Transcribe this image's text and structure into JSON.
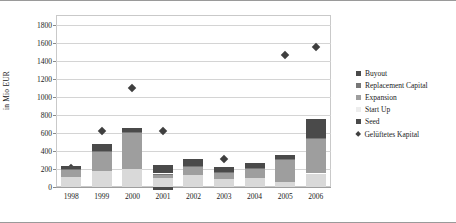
{
  "chart_data": {
    "type": "bar",
    "title": "",
    "subtitle": "",
    "xlabel": "",
    "ylabel": "in Mio EUR",
    "stacked": true,
    "grid": true,
    "legend_position": "right",
    "ylim": [
      0,
      1800
    ],
    "yticks": [
      0,
      200,
      400,
      600,
      800,
      1000,
      1200,
      1400,
      1600,
      1800
    ],
    "categories": [
      "1998",
      "1999",
      "2000",
      "2001",
      "2002",
      "2003",
      "2004",
      "2005",
      "2006"
    ],
    "series": [
      {
        "name": "Seed",
        "color": "#d9d9d9",
        "values": [
          115,
          180,
          205,
          95,
          130,
          90,
          100,
          55,
          150
        ]
      },
      {
        "name": "Start Up",
        "color": "#ededed",
        "values": [
          0,
          0,
          0,
          0,
          0,
          0,
          0,
          0,
          0
        ]
      },
      {
        "name": "Expansion",
        "color": "#9e9e9e",
        "values": [
          70,
          215,
          400,
          45,
          95,
          65,
          100,
          250,
          380
        ]
      },
      {
        "name": "Replacement Capital",
        "color": "#777777",
        "values": [
          10,
          10,
          10,
          10,
          10,
          10,
          10,
          10,
          10
        ]
      },
      {
        "name": "Buyout",
        "color": "#4a4a4a",
        "values": [
          35,
          70,
          45,
          95,
          75,
          60,
          55,
          45,
          220
        ]
      }
    ],
    "negative_series": {
      "name": "Buyout",
      "values": [
        0,
        0,
        0,
        -30,
        0,
        0,
        0,
        0,
        0
      ]
    },
    "marker_series": {
      "name": "Gelüftetes Kapital",
      "color": "#3f3f3f",
      "marker": "diamond",
      "values": [
        250,
        655,
        1130,
        655,
        215,
        350,
        195,
        1500,
        1590
      ]
    }
  },
  "legend": {
    "items": [
      {
        "label": "Buyout",
        "color": "#4a4a4a",
        "shape": "square",
        "icon": "square-swatch-icon"
      },
      {
        "label": "Replacement Capital",
        "color": "#777777",
        "shape": "square",
        "icon": "square-swatch-icon"
      },
      {
        "label": "Expansion",
        "color": "#9e9e9e",
        "shape": "square",
        "icon": "square-swatch-icon"
      },
      {
        "label": "Start Up",
        "color": "#ededed",
        "shape": "square",
        "icon": "square-swatch-icon"
      },
      {
        "label": "Seed",
        "color": "#4a4a4a",
        "shape": "square",
        "icon": "square-swatch-icon"
      },
      {
        "label": "Gelüftetes Kapital",
        "color": "#3f3f3f",
        "shape": "diamond",
        "icon": "diamond-marker-icon"
      }
    ]
  }
}
